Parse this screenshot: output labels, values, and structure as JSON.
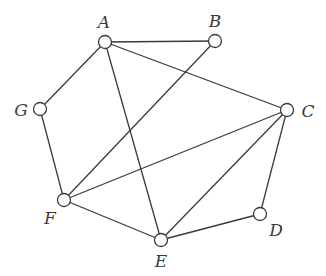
{
  "graph": {
    "nodes": [
      {
        "id": "A",
        "label": "A",
        "x": 105,
        "y": 42,
        "lx": 104,
        "ly": 28
      },
      {
        "id": "B",
        "label": "B",
        "x": 215,
        "y": 41,
        "lx": 215,
        "ly": 27
      },
      {
        "id": "C",
        "label": "C",
        "x": 287,
        "y": 110,
        "lx": 308,
        "ly": 117
      },
      {
        "id": "D",
        "label": "D",
        "x": 260,
        "y": 214,
        "lx": 276,
        "ly": 236
      },
      {
        "id": "E",
        "label": "E",
        "x": 161,
        "y": 240,
        "lx": 161,
        "ly": 267
      },
      {
        "id": "F",
        "label": "F",
        "x": 64,
        "y": 200,
        "lx": 50,
        "ly": 224
      },
      {
        "id": "G",
        "label": "G",
        "x": 40,
        "y": 109,
        "lx": 21,
        "ly": 116
      }
    ],
    "edges": [
      [
        "A",
        "B"
      ],
      [
        "A",
        "G"
      ],
      [
        "A",
        "C"
      ],
      [
        "A",
        "E"
      ],
      [
        "B",
        "F"
      ],
      [
        "G",
        "F"
      ],
      [
        "F",
        "C"
      ],
      [
        "F",
        "E"
      ],
      [
        "E",
        "C"
      ],
      [
        "E",
        "D"
      ],
      [
        "D",
        "C"
      ]
    ],
    "node_radius": 6.5,
    "colors": {
      "stroke": "#3a3a3a",
      "node_fill": "#ffffff",
      "background": "#ffffff"
    }
  }
}
